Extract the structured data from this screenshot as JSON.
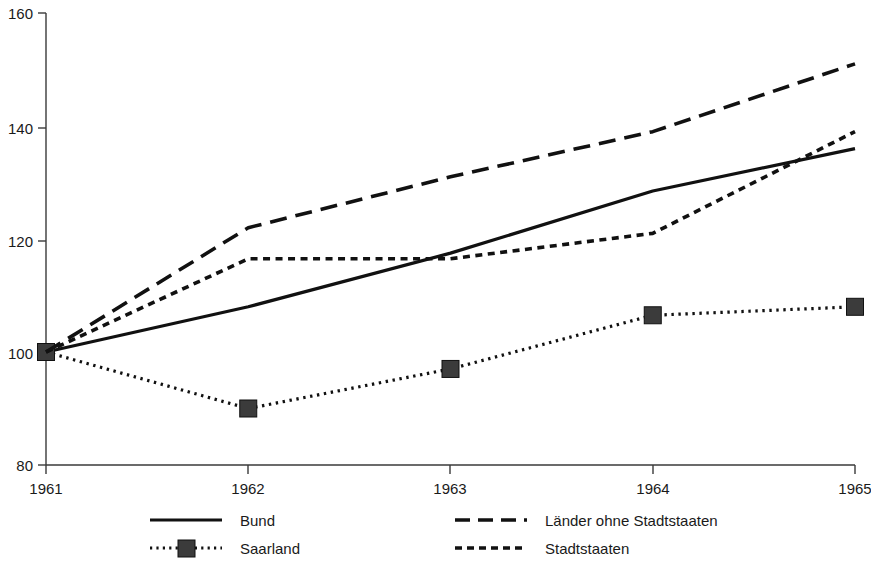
{
  "chart_data": {
    "type": "line",
    "title": "",
    "subtitle": "",
    "xlabel": "",
    "ylabel": "",
    "x": [
      1961,
      1962,
      1963,
      1964,
      1965
    ],
    "categories": [
      "1961",
      "1962",
      "1963",
      "1964",
      "1965"
    ],
    "xtick_labels": [
      "1961",
      "1962",
      "1963",
      "1964",
      "1965"
    ],
    "ytick_labels": [
      "80",
      "100",
      "120",
      "140",
      "160"
    ],
    "ytick_values": [
      80,
      100,
      120,
      140,
      160
    ],
    "ylim": [
      80,
      160
    ],
    "xlim": [
      1961,
      1965
    ],
    "grid": false,
    "legend_position": "bottom",
    "series": [
      {
        "name": "Bund",
        "values": [
          100,
          108,
          117.5,
          128.5,
          136
        ],
        "style": "solid",
        "marker": "none",
        "color": "#111111"
      },
      {
        "name": "Saarland",
        "values": [
          100,
          90,
          97,
          106.5,
          108
        ],
        "style": "dotted",
        "marker": "square",
        "color": "#111111"
      },
      {
        "name": "Länder ohne Stadtstaaten",
        "values": [
          100,
          122,
          131,
          139,
          151
        ],
        "style": "dashed",
        "marker": "none",
        "color": "#111111"
      },
      {
        "name": "Stadtstaaten",
        "values": [
          100,
          116.5,
          116.5,
          121,
          139
        ],
        "style": "dashed-short",
        "marker": "none",
        "color": "#111111"
      }
    ]
  },
  "axis": {
    "y_labels": [
      "160",
      "140",
      "120",
      "100",
      "80"
    ],
    "x_labels": [
      "1961",
      "1962",
      "1963",
      "1964",
      "1965"
    ],
    "axis_color": "#3a3a3a"
  },
  "legend": {
    "entries": [
      {
        "label": "Bund",
        "style": "solid"
      },
      {
        "label": "Länder ohne Stadtstaaten",
        "style": "dashed"
      },
      {
        "label": "Saarland",
        "style": "dotted-marker"
      },
      {
        "label": "Stadtstaaten",
        "style": "dashed-short"
      }
    ]
  }
}
